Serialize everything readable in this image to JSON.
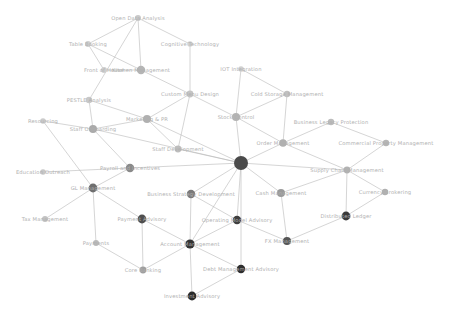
{
  "figure": {
    "kind": "network-graph",
    "background_color": "#ffffff",
    "edge_color": "#b8b8b8",
    "label_color": "#b0b0b0",
    "width": 456,
    "height": 316
  },
  "chart_data": {
    "type": "scatter",
    "title": "",
    "xlabel": "",
    "ylabel": "",
    "layout": "force-directed node-link network",
    "grid": false,
    "legend": false,
    "xlim": [
      0,
      456
    ],
    "ylim": [
      0,
      316
    ],
    "nodes": [
      {
        "id": "open_data_analysis",
        "label": "Open Data Analysis",
        "x": 138,
        "y": 18,
        "r": 3.0,
        "color": "#c9c9c9"
      },
      {
        "id": "table_booking",
        "label": "Table Booking",
        "x": 88,
        "y": 44,
        "r": 3.0,
        "color": "#cfcfcf"
      },
      {
        "id": "cognitive_technology",
        "label": "Cognitive Technology",
        "x": 190,
        "y": 44,
        "r": 2.8,
        "color": "#d2d2d2"
      },
      {
        "id": "front_of_house",
        "label": "Front of House",
        "x": 104,
        "y": 70,
        "r": 3.0,
        "color": "#cfcfcf"
      },
      {
        "id": "kitchen_management",
        "label": "Kitchen Management",
        "x": 141,
        "y": 70,
        "r": 4.2,
        "color": "#b5b5b5"
      },
      {
        "id": "iot_integration",
        "label": "IOT Integration",
        "x": 241,
        "y": 69,
        "r": 2.8,
        "color": "#d0d0d0"
      },
      {
        "id": "custom_menu_design",
        "label": "Custom Menu Design",
        "x": 190,
        "y": 94,
        "r": 3.4,
        "color": "#c4c4c4"
      },
      {
        "id": "cold_storage_management",
        "label": "Cold Storage Management",
        "x": 287,
        "y": 94,
        "r": 3.2,
        "color": "#c0c0c0"
      },
      {
        "id": "pestle_analysis",
        "label": "PESTLE Analysis",
        "x": 89,
        "y": 100,
        "r": 3.2,
        "color": "#c8c8c8"
      },
      {
        "id": "marketing_pr",
        "label": "Marketing & PR",
        "x": 147,
        "y": 119,
        "r": 4.0,
        "color": "#b0b0b0"
      },
      {
        "id": "stock_control",
        "label": "Stock Control",
        "x": 236,
        "y": 117,
        "r": 4.0,
        "color": "#b4b4b4"
      },
      {
        "id": "business_legacy_protection",
        "label": "Business Legacy Protection",
        "x": 331,
        "y": 122,
        "r": 3.2,
        "color": "#bcbcbc"
      },
      {
        "id": "resourcing",
        "label": "Resourcing",
        "x": 43,
        "y": 121,
        "r": 2.8,
        "color": "#cbcbcb"
      },
      {
        "id": "staff_onboarding",
        "label": "Staff Onboarding",
        "x": 93,
        "y": 129,
        "r": 4.0,
        "color": "#aaaaaa"
      },
      {
        "id": "order_management",
        "label": "Order Management",
        "x": 283,
        "y": 143,
        "r": 3.8,
        "color": "#b0b0b0"
      },
      {
        "id": "commercial_property_mgmt",
        "label": "Commercial Property Management",
        "x": 386,
        "y": 143,
        "r": 3.2,
        "color": "#b6b6b6"
      },
      {
        "id": "staff_development",
        "label": "Staff Development",
        "x": 178,
        "y": 149,
        "r": 3.4,
        "color": "#bdbdbd"
      },
      {
        "id": "central_hub",
        "label": "",
        "x": 241,
        "y": 163,
        "r": 7.0,
        "color": "#4a4a4a"
      },
      {
        "id": "payroll_and_incentives",
        "label": "Payroll and Incentives",
        "x": 130,
        "y": 168,
        "r": 4.2,
        "color": "#8a8a8a"
      },
      {
        "id": "education_outreach",
        "label": "Education Outreach",
        "x": 43,
        "y": 172,
        "r": 2.8,
        "color": "#c7c7c7"
      },
      {
        "id": "supply_chain_management",
        "label": "Supply Chain Management",
        "x": 347,
        "y": 170,
        "r": 3.4,
        "color": "#b2b2b2"
      },
      {
        "id": "gl_management",
        "label": "GL Management",
        "x": 93,
        "y": 188,
        "r": 4.4,
        "color": "#6f6f6f"
      },
      {
        "id": "business_strategy_development",
        "label": "Business Strategy Development",
        "x": 191,
        "y": 194,
        "r": 4.2,
        "color": "#7a7a7a"
      },
      {
        "id": "cash_management",
        "label": "Cash Management",
        "x": 281,
        "y": 193,
        "r": 4.0,
        "color": "#9a9a9a"
      },
      {
        "id": "currency_brokering",
        "label": "Currency Brokering",
        "x": 385,
        "y": 192,
        "r": 3.2,
        "color": "#b0b0b0"
      },
      {
        "id": "tax_management",
        "label": "Tax Management",
        "x": 45,
        "y": 219,
        "r": 3.0,
        "color": "#c2c2c2"
      },
      {
        "id": "payment_advisory",
        "label": "Payment Advisory",
        "x": 142,
        "y": 219,
        "r": 4.4,
        "color": "#4f4f4f"
      },
      {
        "id": "operating_model_advisory",
        "label": "Operating Model Advisory",
        "x": 237,
        "y": 220,
        "r": 4.2,
        "color": "#3f3f3f"
      },
      {
        "id": "fx_management",
        "label": "FX Management",
        "x": 287,
        "y": 241,
        "r": 4.0,
        "color": "#555555"
      },
      {
        "id": "distributed_ledger",
        "label": "Distributed Ledger",
        "x": 346,
        "y": 216,
        "r": 4.4,
        "color": "#3a3a3a"
      },
      {
        "id": "payments",
        "label": "Payments",
        "x": 96,
        "y": 243,
        "r": 3.0,
        "color": "#bababa"
      },
      {
        "id": "account_management",
        "label": "Account Management",
        "x": 190,
        "y": 244,
        "r": 4.6,
        "color": "#333333"
      },
      {
        "id": "core_banking",
        "label": "Core Banking",
        "x": 143,
        "y": 270,
        "r": 3.4,
        "color": "#9f9f9f"
      },
      {
        "id": "debt_management_advisory",
        "label": "Debt Management Advisory",
        "x": 241,
        "y": 269,
        "r": 4.2,
        "color": "#2e2e2e"
      },
      {
        "id": "investment_advisory",
        "label": "Investment Advisory",
        "x": 192,
        "y": 296,
        "r": 4.4,
        "color": "#2b2b2b"
      }
    ],
    "edges": [
      [
        "open_data_analysis",
        "kitchen_management"
      ],
      [
        "open_data_analysis",
        "cognitive_technology"
      ],
      [
        "open_data_analysis",
        "table_booking"
      ],
      [
        "open_data_analysis",
        "pestle_analysis"
      ],
      [
        "table_booking",
        "kitchen_management"
      ],
      [
        "front_of_house",
        "kitchen_management"
      ],
      [
        "table_booking",
        "front_of_house"
      ],
      [
        "cognitive_technology",
        "custom_menu_design"
      ],
      [
        "kitchen_management",
        "custom_menu_design"
      ],
      [
        "iot_integration",
        "cold_storage_management"
      ],
      [
        "iot_integration",
        "stock_control"
      ],
      [
        "custom_menu_design",
        "marketing_pr"
      ],
      [
        "custom_menu_design",
        "stock_control"
      ],
      [
        "custom_menu_design",
        "staff_development"
      ],
      [
        "cold_storage_management",
        "stock_control"
      ],
      [
        "cold_storage_management",
        "order_management"
      ],
      [
        "pestle_analysis",
        "marketing_pr"
      ],
      [
        "pestle_analysis",
        "staff_onboarding"
      ],
      [
        "marketing_pr",
        "staff_onboarding"
      ],
      [
        "marketing_pr",
        "staff_development"
      ],
      [
        "marketing_pr",
        "central_hub"
      ],
      [
        "stock_control",
        "order_management"
      ],
      [
        "stock_control",
        "central_hub"
      ],
      [
        "business_legacy_protection",
        "order_management"
      ],
      [
        "business_legacy_protection",
        "commercial_property_mgmt"
      ],
      [
        "resourcing",
        "staff_onboarding"
      ],
      [
        "resourcing",
        "gl_management"
      ],
      [
        "staff_onboarding",
        "payroll_and_incentives"
      ],
      [
        "staff_onboarding",
        "central_hub"
      ],
      [
        "order_management",
        "central_hub"
      ],
      [
        "order_management",
        "supply_chain_management"
      ],
      [
        "commercial_property_mgmt",
        "supply_chain_management"
      ],
      [
        "staff_development",
        "central_hub"
      ],
      [
        "central_hub",
        "payroll_and_incentives"
      ],
      [
        "central_hub",
        "business_strategy_development"
      ],
      [
        "central_hub",
        "cash_management"
      ],
      [
        "central_hub",
        "operating_model_advisory"
      ],
      [
        "central_hub",
        "account_management"
      ],
      [
        "central_hub",
        "supply_chain_management"
      ],
      [
        "central_hub",
        "debt_management_advisory"
      ],
      [
        "payroll_and_incentives",
        "education_outreach"
      ],
      [
        "payroll_and_incentives",
        "gl_management"
      ],
      [
        "supply_chain_management",
        "cash_management"
      ],
      [
        "supply_chain_management",
        "currency_brokering"
      ],
      [
        "supply_chain_management",
        "distributed_ledger"
      ],
      [
        "gl_management",
        "tax_management"
      ],
      [
        "gl_management",
        "payment_advisory"
      ],
      [
        "gl_management",
        "payments"
      ],
      [
        "business_strategy_development",
        "operating_model_advisory"
      ],
      [
        "business_strategy_development",
        "account_management"
      ],
      [
        "cash_management",
        "fx_management"
      ],
      [
        "currency_brokering",
        "distributed_ledger"
      ],
      [
        "payment_advisory",
        "core_banking"
      ],
      [
        "payment_advisory",
        "account_management"
      ],
      [
        "operating_model_advisory",
        "account_management"
      ],
      [
        "operating_model_advisory",
        "fx_management"
      ],
      [
        "fx_management",
        "distributed_ledger"
      ],
      [
        "payments",
        "core_banking"
      ],
      [
        "account_management",
        "core_banking"
      ],
      [
        "account_management",
        "debt_management_advisory"
      ],
      [
        "account_management",
        "investment_advisory"
      ],
      [
        "debt_management_advisory",
        "investment_advisory"
      ]
    ]
  }
}
